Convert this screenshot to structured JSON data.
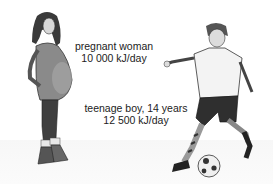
{
  "figures": [
    {
      "id": "pregnant-woman",
      "label": "pregnant woman",
      "energy": "10 000 kJ/day"
    },
    {
      "id": "teenage-boy",
      "label": "teenage boy, 14 years",
      "energy": "12 500 kJ/day"
    }
  ],
  "colors": {
    "ink": "#222222",
    "shadow": "#4a4a4a",
    "background": "#ffffff"
  }
}
